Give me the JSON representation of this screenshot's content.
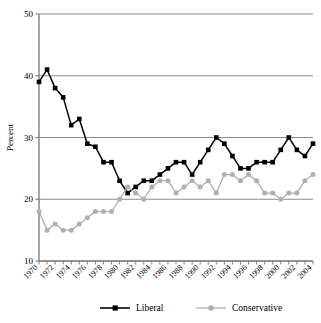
{
  "chart_data": {
    "type": "line",
    "title": "",
    "xlabel": "",
    "ylabel": "Percent",
    "ylim": [
      10,
      50
    ],
    "yticks": [
      10,
      20,
      30,
      40,
      50
    ],
    "ytick_labels": [
      "10",
      "20",
      "30",
      "40",
      "50"
    ],
    "xlim": [
      1970,
      2004
    ],
    "grid": "horizontal",
    "legend_position": "bottom",
    "x": [
      1970,
      1971,
      1972,
      1973,
      1974,
      1975,
      1976,
      1977,
      1978,
      1979,
      1980,
      1981,
      1982,
      1983,
      1984,
      1985,
      1986,
      1987,
      1988,
      1989,
      1990,
      1991,
      1992,
      1993,
      1994,
      1995,
      1996,
      1997,
      1998,
      1999,
      2000,
      2001,
      2002,
      2003,
      2004
    ],
    "xtick_labels": [
      "1970",
      "1972",
      "1974",
      "1976",
      "1978",
      "1980",
      "1982",
      "1984",
      "1986",
      "1988",
      "1990",
      "1992",
      "1994",
      "1996",
      "1998",
      "2000",
      "2002",
      "2004"
    ],
    "xtick_values": [
      1970,
      1972,
      1974,
      1976,
      1978,
      1980,
      1982,
      1984,
      1986,
      1988,
      1990,
      1992,
      1994,
      1996,
      1998,
      2000,
      2002,
      2004
    ],
    "series": [
      {
        "name": "Liberal",
        "color": "#000000",
        "marker": "square",
        "values": [
          39,
          41,
          38,
          36.5,
          32,
          33,
          29,
          28.5,
          26,
          26,
          23,
          21,
          22,
          23,
          23,
          24,
          25,
          26,
          26,
          24,
          26,
          28,
          30,
          29,
          27,
          25,
          25,
          26,
          26,
          26,
          28,
          30,
          28,
          27,
          29
        ]
      },
      {
        "name": "Conservative",
        "color": "#b0b0b0",
        "marker": "circle",
        "values": [
          18,
          15,
          16,
          15,
          15,
          16,
          17,
          18,
          18,
          18,
          20,
          22,
          21,
          20,
          22,
          23,
          23,
          21,
          22,
          23,
          22,
          23,
          21,
          24,
          24,
          23,
          24,
          23,
          21,
          21,
          20,
          21,
          21,
          23,
          24
        ]
      }
    ]
  },
  "legend": {
    "items": [
      {
        "label": "Liberal",
        "color": "#000000",
        "marker": "square"
      },
      {
        "label": "Conservative",
        "color": "#b0b0b0",
        "marker": "circle"
      }
    ]
  }
}
